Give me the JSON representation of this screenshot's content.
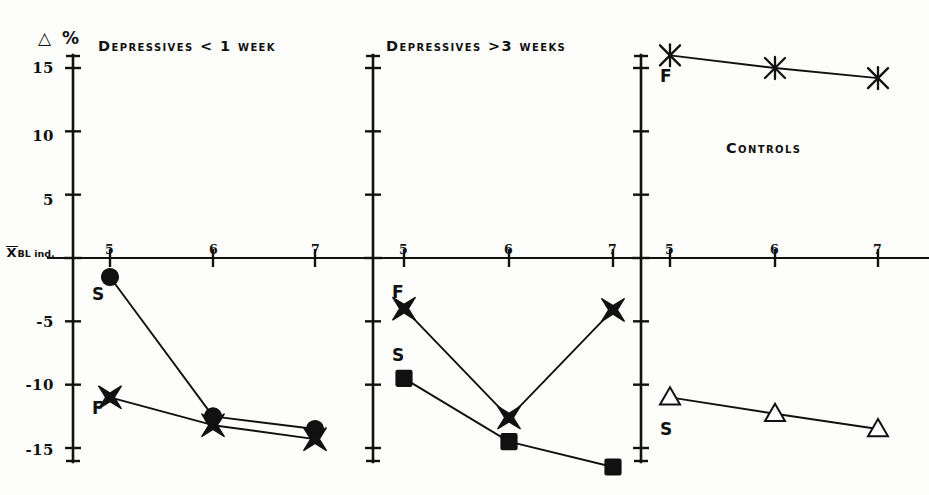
{
  "figure": {
    "y_axis_unit_symbol": "△",
    "y_axis_unit_label": "%",
    "baseline_label_main": "X",
    "baseline_label_sub": "BL ind.",
    "background_color": "#fdfdfb",
    "ink_color": "#111111"
  },
  "chart_data": {
    "type": "line",
    "title": "",
    "xlabel": "",
    "ylabel": "△ %",
    "ylim": [
      -17.5,
      17.0
    ],
    "yticks": [
      15,
      10,
      5,
      0,
      -5,
      -10,
      -15
    ],
    "ytick_labels": [
      "15",
      "10",
      "5",
      "X̄ BL ind.",
      "-5",
      "-10",
      "-15"
    ],
    "x": [
      5,
      6,
      7
    ],
    "xtick_labels": [
      "5",
      "6",
      "7"
    ],
    "grid": false,
    "legend": "inline-labels",
    "panels": [
      {
        "id": "panel-depressives-lt1week",
        "title": "Depressives < 1 week",
        "series": [
          {
            "name": "S",
            "label": "S",
            "marker": "filled-circle",
            "values": [
              -1.5,
              -12.5,
              -13.5
            ]
          },
          {
            "name": "F",
            "label": "F",
            "marker": "filled-x-star",
            "values": [
              -11.0,
              -13.2,
              -14.3
            ]
          }
        ]
      },
      {
        "id": "panel-depressives-gt3weeks",
        "title": "Depressives >3 weeks",
        "series": [
          {
            "name": "F",
            "label": "F",
            "marker": "filled-x-star",
            "values": [
              -4.0,
              -12.6,
              -4.1
            ]
          },
          {
            "name": "S",
            "label": "S",
            "marker": "filled-square",
            "values": [
              -9.5,
              -14.5,
              -16.5
            ]
          }
        ]
      },
      {
        "id": "panel-controls",
        "title": "Controls",
        "series": [
          {
            "name": "F",
            "label": "F",
            "marker": "open-x-star",
            "values": [
              16.0,
              15.0,
              14.2
            ]
          },
          {
            "name": "S",
            "label": "S",
            "marker": "open-triangle",
            "values": [
              -11.0,
              -12.3,
              -13.5
            ]
          }
        ]
      }
    ]
  }
}
